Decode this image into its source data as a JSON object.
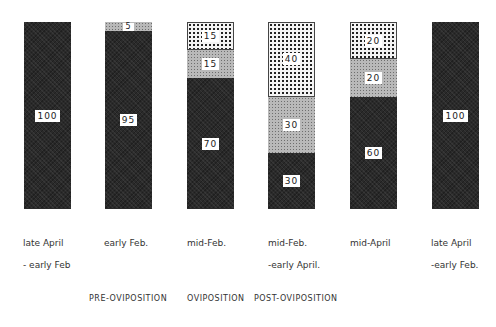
{
  "chart_data": {
    "type": "bar",
    "stacked": true,
    "normalized_percent": true,
    "categories": [
      "late April - early Feb.",
      "early Feb.",
      "mid-Feb.",
      "mid-Feb. - early April.",
      "mid-April",
      "late April - early Feb."
    ],
    "series": [
      {
        "name": "dark",
        "values": [
          100,
          95,
          70,
          30,
          60,
          100
        ]
      },
      {
        "name": "medium-stipple",
        "values": [
          0,
          5,
          15,
          30,
          20,
          0
        ]
      },
      {
        "name": "light-dotted",
        "values": [
          0,
          0,
          15,
          40,
          20,
          0
        ]
      }
    ],
    "phases": [
      "PRE-OVIPOSITION",
      "OVIPOSITION",
      "POST-OVIPOSITION"
    ],
    "ylim": [
      0,
      100
    ]
  },
  "bars": [
    {
      "label1": "late April",
      "label2": "- early Feb",
      "segments": [
        {
          "cls": "dark",
          "pct": 100,
          "text": "100"
        }
      ]
    },
    {
      "label1": "early Feb.",
      "label2": "",
      "segments": [
        {
          "cls": "medium",
          "pct": 5,
          "text": "5"
        },
        {
          "cls": "dark",
          "pct": 95,
          "text": "95"
        }
      ]
    },
    {
      "label1": "mid-Feb.",
      "label2": "",
      "segments": [
        {
          "cls": "light",
          "pct": 15,
          "text": "15"
        },
        {
          "cls": "medium",
          "pct": 15,
          "text": "15"
        },
        {
          "cls": "dark",
          "pct": 70,
          "text": "70"
        }
      ]
    },
    {
      "label1": "mid-Feb.",
      "label2": "-early April.",
      "segments": [
        {
          "cls": "light",
          "pct": 40,
          "text": "40"
        },
        {
          "cls": "medium",
          "pct": 30,
          "text": "30"
        },
        {
          "cls": "dark",
          "pct": 30,
          "text": "30"
        }
      ]
    },
    {
      "label1": "mid-April",
      "label2": "",
      "segments": [
        {
          "cls": "light",
          "pct": 20,
          "text": "20"
        },
        {
          "cls": "medium",
          "pct": 20,
          "text": "20"
        },
        {
          "cls": "dark",
          "pct": 60,
          "text": "60"
        }
      ]
    },
    {
      "label1": "late April",
      "label2": "-early Feb.",
      "segments": [
        {
          "cls": "dark",
          "pct": 100,
          "text": "100"
        }
      ]
    }
  ],
  "phases": {
    "pre": "PRE-OVIPOSITION",
    "ovi": "OVIPOSITION",
    "post": "POST-OVIPOSITION"
  }
}
